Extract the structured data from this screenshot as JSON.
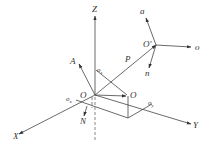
{
  "diagram": {
    "type": "coordinate-frame-diagram",
    "colors": {
      "line": "#444444",
      "text": "#333333",
      "background": "#ffffff"
    },
    "base_frame": {
      "origin_label": "O",
      "axes": [
        {
          "name": "X",
          "label": "X"
        },
        {
          "name": "Y",
          "label": "Y"
        },
        {
          "name": "Z",
          "label": "Z"
        }
      ],
      "projections": {
        "ox": "o",
        "ox_sub": "x",
        "oy": "o",
        "oy_sub": "y",
        "oz": "o",
        "oz_sub": "z"
      }
    },
    "tool_frame": {
      "origin_label": "O'",
      "axes": [
        {
          "name": "a",
          "label": "a"
        },
        {
          "name": "o",
          "label": "o"
        },
        {
          "name": "n",
          "label": "n"
        }
      ]
    },
    "vectors": {
      "position": "P",
      "approach": "A",
      "normal": "N",
      "projection_point": "O"
    }
  }
}
